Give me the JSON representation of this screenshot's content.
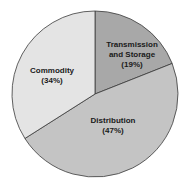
{
  "chart_data": {
    "type": "pie",
    "title": "",
    "categories": [
      "Transmission and Storage",
      "Distribution",
      "Commodity"
    ],
    "values": [
      19,
      47,
      34
    ],
    "labels": [
      {
        "line1": "Transmission",
        "line2": "and Storage",
        "pct": "(19%)"
      },
      {
        "line1": "Distribution",
        "pct": "(47%)"
      },
      {
        "line1": "Commodity",
        "pct": "(34%)"
      }
    ],
    "colors": [
      "#a8a8a8",
      "#c4c4c4",
      "#e4e4e4"
    ],
    "start_angle": "12 o'clock, clockwise",
    "legend": "none (labels inside slices)"
  }
}
